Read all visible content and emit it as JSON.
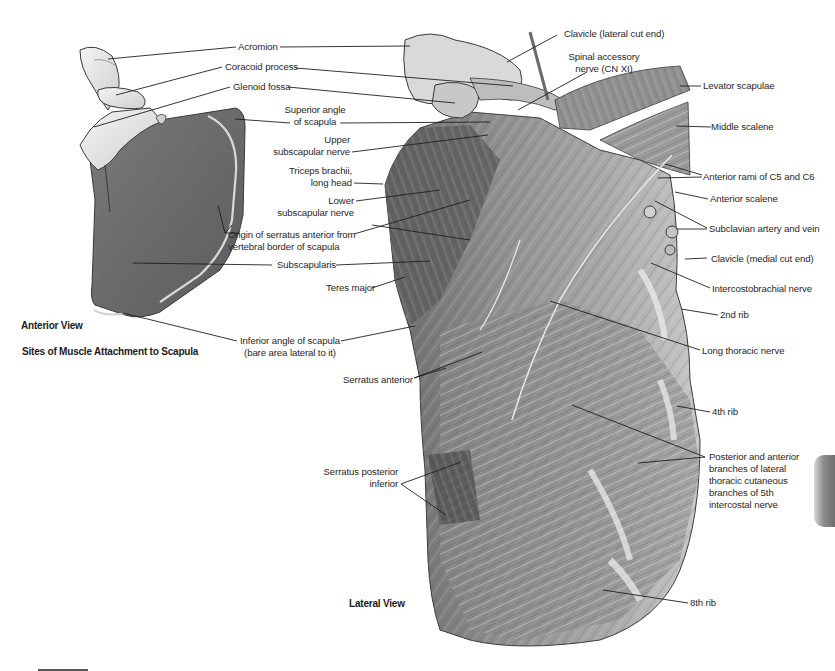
{
  "figure": {
    "anterior_view": {
      "title": "Anterior View",
      "subtitle": "Sites of Muscle Attachment to Scapula"
    },
    "lateral_view": {
      "title": "Lateral View"
    },
    "labels": {
      "acromion": "Acromion",
      "coracoid_process": "Coracoid process",
      "glenoid_fossa": "Glenoid fossa",
      "superior_angle_1": "Superior angle",
      "superior_angle_2": "of scapula",
      "upper_subscapular_1": "Upper",
      "upper_subscapular_2": "subscapular nerve",
      "triceps_1": "Triceps brachii,",
      "triceps_2": "long head",
      "lower_subscapular_1": "Lower",
      "lower_subscapular_2": "subscapular nerve",
      "serratus_origin_1": "Origin of serratus anterior from",
      "serratus_origin_2": "vertebral border of scapula",
      "subscapularis": "Subscapularis",
      "teres_major": "Teres major",
      "inferior_angle_1": "Inferior angle of scapula",
      "inferior_angle_2": "(bare area lateral to it)",
      "serratus_anterior": "Serratus anterior",
      "serratus_posterior_1": "Serratus posterior",
      "serratus_posterior_2": "inferior",
      "clavicle_lateral": "Clavicle (lateral cut end)",
      "spinal_accessory_1": "Spinal accessory",
      "spinal_accessory_2": "nerve (CN XI)",
      "levator_scapulae": "Levator scapulae",
      "middle_scalene": "Middle scalene",
      "anterior_rami": "Anterior rami of C5 and C6",
      "anterior_scalene": "Anterior scalene",
      "subclavian": "Subclavian artery and vein",
      "clavicle_medial": "Clavicle (medial cut end)",
      "intercostobrachial": "Intercostobrachial nerve",
      "rib_2": "2nd rib",
      "long_thoracic": "Long thoracic nerve",
      "rib_4": "4th rib",
      "post_ant_branches_1": "Posterior and anterior",
      "post_ant_branches_2": "branches of lateral",
      "post_ant_branches_3": "thoracic cutaneous",
      "post_ant_branches_4": "branches of 5th",
      "post_ant_branches_5": "intercostal nerve",
      "rib_8": "8th rib"
    },
    "colors": {
      "scapula_fill": "#6d6d6d",
      "bone_fill": "#e6e6e6",
      "muscle_dark": "#5a5a5a",
      "muscle_light": "#bdbdbd",
      "leader_line": "#1f1f1f"
    }
  }
}
